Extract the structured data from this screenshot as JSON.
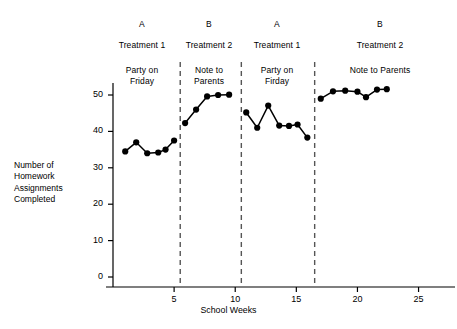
{
  "chart_data": {
    "type": "line",
    "title": "",
    "xlabel": "School Weeks",
    "ylabel": "Number of\nHomework\nAssignments\nCompleted",
    "ylabel_lines": [
      "Number of",
      "Homework",
      "Assignments",
      "Completed"
    ],
    "xlim": [
      0,
      27
    ],
    "ylim": [
      0,
      54
    ],
    "yticks": [
      0,
      10,
      20,
      30,
      40,
      50
    ],
    "ytick_labels": [
      "0",
      "10",
      "20",
      "30",
      "40",
      "50"
    ],
    "xticks": [
      5,
      10,
      15,
      20,
      25
    ],
    "xtick_labels": [
      "5",
      "10",
      "15",
      "20",
      "25"
    ],
    "grid": false,
    "legend": "none",
    "marker": "filled-circle",
    "line_color": "#000000",
    "marker_color": "#000000",
    "axis_color": "#000000",
    "phase_line_color": "#555555",
    "phase_line_style": "dashed",
    "phase_dividers_x": [
      5.5,
      10.5,
      16.5
    ],
    "series": [
      {
        "name": "A Treatment 1 (Party on Friday) — first phase",
        "x": [
          1.0,
          1.9,
          2.8,
          3.7,
          4.3,
          5.0
        ],
        "values": [
          34.5,
          37.0,
          34.0,
          34.2,
          35.0,
          37.5
        ]
      },
      {
        "name": "B Treatment 2 (Note to Parents) — second phase",
        "x": [
          5.9,
          6.8,
          7.7,
          8.6,
          9.5
        ],
        "values": [
          42.3,
          46.0,
          49.6,
          50.0,
          50.1
        ]
      },
      {
        "name": "A Treatment 1 (Party on Firday) — third phase",
        "x": [
          10.9,
          11.8,
          12.7,
          13.6,
          14.4,
          15.1,
          15.9
        ],
        "values": [
          45.2,
          41.0,
          47.1,
          41.6,
          41.5,
          41.9,
          38.3
        ]
      },
      {
        "name": "B Treatment 2 (Note to Parents) — fourth phase",
        "x": [
          17.0,
          18.0,
          19.0,
          20.0,
          20.7,
          21.6,
          22.4
        ],
        "values": [
          49.0,
          51.0,
          51.2,
          50.9,
          49.4,
          51.5,
          51.6
        ]
      }
    ],
    "phases": [
      {
        "letter": "A",
        "treatment": "Treatment 1",
        "description": "Party on\nFriday",
        "desc_lines": [
          "Party on",
          "Friday"
        ]
      },
      {
        "letter": "B",
        "treatment": "Treatment 2",
        "description": "Note to\nParents",
        "desc_lines": [
          "Note to",
          "Parents"
        ]
      },
      {
        "letter": "A",
        "treatment": "Treatment 1",
        "description": "Party on\nFirday",
        "desc_lines": [
          "Party on",
          "Firday"
        ]
      },
      {
        "letter": "B",
        "treatment": "Treatment 2",
        "description": "Note to Parents",
        "desc_lines": [
          "Note to Parents"
        ]
      }
    ]
  }
}
